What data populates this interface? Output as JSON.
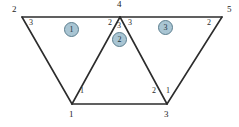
{
  "figure": {
    "colors": {
      "line": "#2c2c2c",
      "badge_fill": "#a9c5d3",
      "badge_stroke": "#5d7f8f",
      "badge_text": "#20343d",
      "label_text": "#232323",
      "background": "#ffffff"
    },
    "geometry": {
      "top_left": [
        22,
        17
      ],
      "apex": [
        120,
        17
      ],
      "top_right": [
        222,
        17
      ],
      "bottom_left": [
        72,
        104
      ],
      "bottom_right": [
        167,
        104
      ]
    },
    "edges": [
      {
        "name": "top-edge-left",
        "from": "top_left",
        "to": "apex"
      },
      {
        "name": "top-edge-right",
        "from": "apex",
        "to": "top_right"
      },
      {
        "name": "bottom-edge",
        "from": "bottom_left",
        "to": "bottom_right"
      },
      {
        "name": "left-slant",
        "from": "top_left",
        "to": "bottom_left"
      },
      {
        "name": "inner-left-slant",
        "from": "bottom_left",
        "to": "apex"
      },
      {
        "name": "inner-right-slant",
        "from": "apex",
        "to": "bottom_right"
      },
      {
        "name": "right-slant",
        "from": "bottom_right",
        "to": "top_right"
      }
    ],
    "global_nodes": [
      {
        "name": "global-node-top-left",
        "label": "2",
        "x": 12,
        "y": 10
      },
      {
        "name": "global-node-apex",
        "label": "4",
        "x": 117,
        "y": 2
      },
      {
        "name": "global-node-top-right",
        "label": "5",
        "x": 227,
        "y": 10
      },
      {
        "name": "global-node-bottom-left",
        "label": "1",
        "x": 69,
        "y": 112
      },
      {
        "name": "global-node-bottom-right",
        "label": "3",
        "x": 164,
        "y": 112
      }
    ],
    "local_nodes": [
      {
        "name": "local-node-e1-n3",
        "label": "3",
        "x": 29,
        "y": 19
      },
      {
        "name": "local-node-e1-n2",
        "label": "2",
        "x": 110,
        "y": 19
      },
      {
        "name": "local-node-e1-n1",
        "label": "1",
        "x": 81,
        "y": 91
      },
      {
        "name": "local-node-e2-n3",
        "label": "3",
        "x": 118,
        "y": 22
      },
      {
        "name": "local-node-e2-n2",
        "label": "2",
        "x": 153,
        "y": 91
      },
      {
        "name": "local-node-e3-n3",
        "label": "3",
        "x": 129,
        "y": 19
      },
      {
        "name": "local-node-e3-n2",
        "label": "2",
        "x": 207,
        "y": 19
      },
      {
        "name": "local-node-e3-n1",
        "label": "1",
        "x": 166,
        "y": 91
      }
    ],
    "elements": [
      {
        "name": "element-badge-1",
        "label": "1",
        "x": 64,
        "y": 22
      },
      {
        "name": "element-badge-2",
        "label": "2",
        "x": 112,
        "y": 32
      },
      {
        "name": "element-badge-3",
        "label": "3",
        "x": 158,
        "y": 20
      }
    ]
  }
}
